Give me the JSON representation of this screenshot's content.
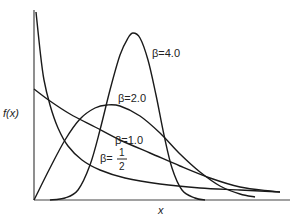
{
  "chart_data": {
    "type": "line",
    "title": "",
    "xlabel": "x",
    "ylabel": "f(x)",
    "grid": false,
    "legend": "inline labels",
    "series": [
      {
        "name": "β=1/2",
        "label": "β=",
        "label_frac_num": "1",
        "label_frac_den": "2",
        "points": [
          [
            36,
            12
          ],
          [
            40,
            50
          ],
          [
            44,
            80
          ],
          [
            50,
            105
          ],
          [
            58,
            128
          ],
          [
            68,
            146
          ],
          [
            82,
            160
          ],
          [
            100,
            170
          ],
          [
            125,
            178
          ],
          [
            160,
            184
          ],
          [
            200,
            188
          ],
          [
            240,
            190
          ],
          [
            280,
            192
          ]
        ]
      },
      {
        "name": "β=1.0",
        "label": "β=1.0",
        "points": [
          [
            34,
            89
          ],
          [
            50,
            101
          ],
          [
            70,
            114
          ],
          [
            95,
            127
          ],
          [
            120,
            140
          ],
          [
            150,
            153
          ],
          [
            180,
            166
          ],
          [
            210,
            178
          ],
          [
            240,
            187
          ],
          [
            270,
            191
          ],
          [
            280,
            192
          ]
        ]
      },
      {
        "name": "β=2.0",
        "label": "β=2.0",
        "points": [
          [
            34,
            200
          ],
          [
            50,
            168
          ],
          [
            65,
            140
          ],
          [
            80,
            119
          ],
          [
            95,
            108
          ],
          [
            107,
            105
          ],
          [
            120,
            106
          ],
          [
            140,
            116
          ],
          [
            160,
            133
          ],
          [
            180,
            154
          ],
          [
            200,
            172
          ],
          [
            220,
            186
          ],
          [
            240,
            194
          ],
          [
            255,
            197
          ]
        ]
      },
      {
        "name": "β=4.0",
        "label": "β=4.0",
        "points": [
          [
            50,
            200
          ],
          [
            65,
            198
          ],
          [
            78,
            190
          ],
          [
            90,
            165
          ],
          [
            100,
            130
          ],
          [
            110,
            90
          ],
          [
            120,
            55
          ],
          [
            128,
            38
          ],
          [
            133,
            33
          ],
          [
            140,
            38
          ],
          [
            148,
            60
          ],
          [
            156,
            95
          ],
          [
            164,
            135
          ],
          [
            172,
            168
          ],
          [
            182,
            190
          ],
          [
            195,
            198
          ],
          [
            205,
            200
          ]
        ]
      }
    ],
    "xlim": [
      34,
      290
    ],
    "ylim": [
      200,
      12
    ]
  },
  "labels": {
    "ylabel": "f(x)",
    "xlabel": "x",
    "beta4": "β=4.0",
    "beta2": "β=2.0",
    "beta1": "β=1.0",
    "betahalf_prefix": "β=",
    "betahalf_num": "1",
    "betahalf_den": "2"
  }
}
